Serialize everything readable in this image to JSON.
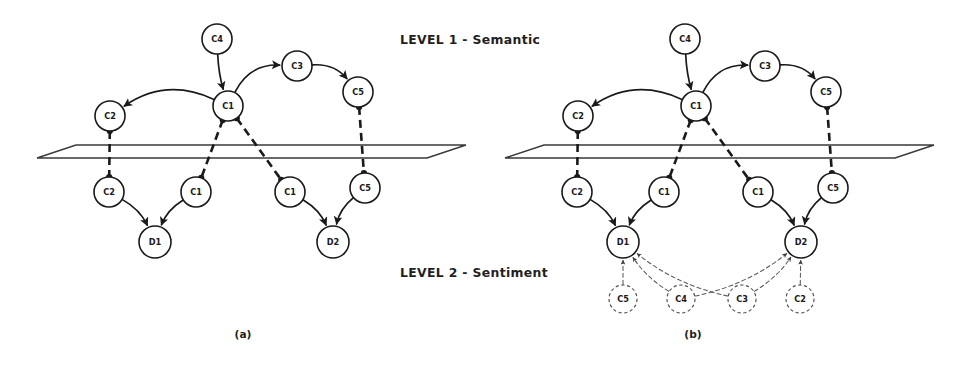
{
  "figure": {
    "caption_a": "(a)",
    "caption_b": "(b)",
    "level1_label": "LEVEL 1 - Semantic",
    "level2_label": "LEVEL 2 - Sentiment",
    "colors": {
      "ink": "#1a1a1a",
      "plane_stroke": "#3a3a3a",
      "dashed_ghost": "#5a5a5a",
      "background": "#ffffff"
    }
  },
  "panels": [
    {
      "id": "panel-a",
      "caption": "(a)",
      "caption_pos": {
        "x": 243,
        "y": 338
      },
      "plane": {
        "name": "separation-plane",
        "points": "37,158 76,145 466,145 427,158"
      },
      "semantic_nodes": [
        {
          "id": "a-c4-top",
          "label": "C4",
          "x": 217,
          "y": 39,
          "r": 15
        },
        {
          "id": "a-c1-hub",
          "label": "C1",
          "x": 228,
          "y": 106,
          "r": 15
        },
        {
          "id": "a-c3-top",
          "label": "C3",
          "x": 297,
          "y": 66,
          "r": 15
        },
        {
          "id": "a-c5-top",
          "label": "C5",
          "x": 358,
          "y": 92,
          "r": 15
        },
        {
          "id": "a-c2-top",
          "label": "C2",
          "x": 110,
          "y": 116,
          "r": 15
        }
      ],
      "sentiment_nodes": [
        {
          "id": "a-c2-low",
          "label": "C2",
          "x": 109,
          "y": 192,
          "r": 15
        },
        {
          "id": "a-c1-low1",
          "label": "C1",
          "x": 196,
          "y": 192,
          "r": 15
        },
        {
          "id": "a-c1-low2",
          "label": "C1",
          "x": 290,
          "y": 192,
          "r": 15
        },
        {
          "id": "a-c5-low",
          "label": "C5",
          "x": 365,
          "y": 188,
          "r": 15
        },
        {
          "id": "a-d1",
          "label": "D1",
          "x": 155,
          "y": 242,
          "r": 16
        },
        {
          "id": "a-d2",
          "label": "D2",
          "x": 333,
          "y": 242,
          "r": 16
        }
      ],
      "ghost_nodes": [],
      "edges_curved": [
        {
          "from": "a-c4-top",
          "to": "a-c1-hub",
          "style": "solid",
          "arrow": true
        },
        {
          "from": "a-c1-hub",
          "to": "a-c2-top",
          "style": "solid",
          "arrow": true
        },
        {
          "from": "a-c1-hub",
          "to": "a-c3-top",
          "style": "solid",
          "arrow": true
        },
        {
          "from": "a-c3-top",
          "to": "a-c5-top",
          "style": "solid",
          "arrow": true
        },
        {
          "from": "a-c2-low",
          "to": "a-d1",
          "style": "solid",
          "arrow": true
        },
        {
          "from": "a-c1-low1",
          "to": "a-d1",
          "style": "solid",
          "arrow": true
        },
        {
          "from": "a-c1-low2",
          "to": "a-d2",
          "style": "solid",
          "arrow": true
        },
        {
          "from": "a-c5-low",
          "to": "a-d2",
          "style": "solid",
          "arrow": true
        }
      ],
      "edges_projection": [
        {
          "from": "a-c2-top",
          "to": "a-c2-low",
          "style": "thick-dashed"
        },
        {
          "from": "a-c1-hub",
          "to": "a-c1-low1",
          "style": "thick-dashed"
        },
        {
          "from": "a-c1-hub",
          "to": "a-c1-low2",
          "style": "thick-dashed"
        },
        {
          "from": "a-c5-top",
          "to": "a-c5-low",
          "style": "thick-dashed"
        }
      ],
      "edges_ghost": []
    },
    {
      "id": "panel-b",
      "caption": "(b)",
      "caption_pos": {
        "x": 693,
        "y": 338
      },
      "plane": {
        "name": "separation-plane",
        "points": "505,158 544,145 934,145 895,158"
      },
      "semantic_nodes": [
        {
          "id": "b-c4-top",
          "label": "C4",
          "x": 685,
          "y": 39,
          "r": 15
        },
        {
          "id": "b-c1-hub",
          "label": "C1",
          "x": 696,
          "y": 106,
          "r": 15
        },
        {
          "id": "b-c3-top",
          "label": "C3",
          "x": 765,
          "y": 66,
          "r": 15
        },
        {
          "id": "b-c5-top",
          "label": "C5",
          "x": 826,
          "y": 92,
          "r": 15
        },
        {
          "id": "b-c2-top",
          "label": "C2",
          "x": 578,
          "y": 116,
          "r": 15
        }
      ],
      "sentiment_nodes": [
        {
          "id": "b-c2-low",
          "label": "C2",
          "x": 577,
          "y": 192,
          "r": 15
        },
        {
          "id": "b-c1-low1",
          "label": "C1",
          "x": 664,
          "y": 192,
          "r": 15
        },
        {
          "id": "b-c1-low2",
          "label": "C1",
          "x": 758,
          "y": 192,
          "r": 15
        },
        {
          "id": "b-c5-low",
          "label": "C5",
          "x": 833,
          "y": 188,
          "r": 15
        },
        {
          "id": "b-d1",
          "label": "D1",
          "x": 623,
          "y": 242,
          "r": 16
        },
        {
          "id": "b-d2",
          "label": "D2",
          "x": 801,
          "y": 242,
          "r": 16
        }
      ],
      "ghost_nodes": [
        {
          "id": "b-g-c5",
          "label": "C5",
          "x": 623,
          "y": 299,
          "r": 14
        },
        {
          "id": "b-g-c4",
          "label": "C4",
          "x": 681,
          "y": 299,
          "r": 14
        },
        {
          "id": "b-g-c3",
          "label": "C3",
          "x": 742,
          "y": 299,
          "r": 14
        },
        {
          "id": "b-g-c2",
          "label": "C2",
          "x": 800,
          "y": 299,
          "r": 14
        }
      ],
      "edges_curved": [
        {
          "from": "b-c4-top",
          "to": "b-c1-hub",
          "style": "solid",
          "arrow": true
        },
        {
          "from": "b-c1-hub",
          "to": "b-c2-top",
          "style": "solid",
          "arrow": true
        },
        {
          "from": "b-c1-hub",
          "to": "b-c3-top",
          "style": "solid",
          "arrow": true
        },
        {
          "from": "b-c3-top",
          "to": "b-c5-top",
          "style": "solid",
          "arrow": true
        },
        {
          "from": "b-c2-low",
          "to": "b-d1",
          "style": "solid",
          "arrow": true
        },
        {
          "from": "b-c1-low1",
          "to": "b-d1",
          "style": "solid",
          "arrow": true
        },
        {
          "from": "b-c1-low2",
          "to": "b-d2",
          "style": "solid",
          "arrow": true
        },
        {
          "from": "b-c5-low",
          "to": "b-d2",
          "style": "solid",
          "arrow": true
        }
      ],
      "edges_projection": [
        {
          "from": "b-c2-top",
          "to": "b-c2-low",
          "style": "thick-dashed"
        },
        {
          "from": "b-c1-hub",
          "to": "b-c1-low1",
          "style": "thick-dashed"
        },
        {
          "from": "b-c1-hub",
          "to": "b-c1-low2",
          "style": "thick-dashed"
        },
        {
          "from": "b-c5-top",
          "to": "b-c5-low",
          "style": "thick-dashed"
        }
      ],
      "edges_ghost": [
        {
          "from": "b-g-c5",
          "to": "b-d1",
          "style": "thin-dashed",
          "arrow": true
        },
        {
          "from": "b-g-c4",
          "to": "b-d1",
          "style": "thin-dashed",
          "arrow": true
        },
        {
          "from": "b-g-c4",
          "to": "b-d2",
          "style": "thin-dashed",
          "arrow": true
        },
        {
          "from": "b-g-c3",
          "to": "b-d1",
          "style": "thin-dashed",
          "arrow": true
        },
        {
          "from": "b-g-c3",
          "to": "b-d2",
          "style": "thin-dashed",
          "arrow": true
        },
        {
          "from": "b-g-c2",
          "to": "b-d2",
          "style": "thin-dashed",
          "arrow": true
        }
      ]
    }
  ],
  "annotations": [
    {
      "id": "level1",
      "text": "LEVEL 1 - Semantic",
      "x": 400,
      "y": 44
    },
    {
      "id": "level2",
      "text": "LEVEL 2 - Sentiment",
      "x": 400,
      "y": 277
    }
  ]
}
